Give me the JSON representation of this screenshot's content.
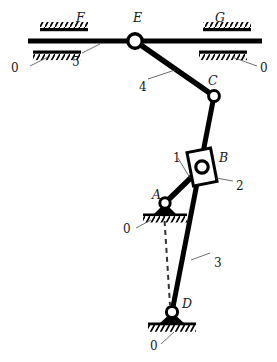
{
  "figure": {
    "background_color": "#ffffff",
    "line_color": "#000000",
    "label_color": "#1a1a1a",
    "width": 277,
    "height": 362
  },
  "joint_labels": [
    {
      "id": "F",
      "text": "F",
      "x": 76,
      "y": 12,
      "kind": "slider-guide-label"
    },
    {
      "id": "E",
      "text": "E",
      "x": 133,
      "y": 12,
      "kind": "pin-joint-label"
    },
    {
      "id": "G",
      "text": "G",
      "x": 215,
      "y": 12,
      "kind": "slider-guide-label"
    },
    {
      "id": "C",
      "text": "C",
      "x": 208,
      "y": 75,
      "kind": "pin-joint-label"
    },
    {
      "id": "B",
      "text": "B",
      "x": 219,
      "y": 152,
      "kind": "slider-block-label"
    },
    {
      "id": "A",
      "text": "A",
      "x": 152,
      "y": 189,
      "kind": "ground-pivot-label"
    },
    {
      "id": "D",
      "text": "D",
      "x": 182,
      "y": 298,
      "kind": "ground-pivot-label"
    }
  ],
  "link_labels": [
    {
      "id": "link5",
      "text": "5",
      "x": 72,
      "y": 56,
      "member": "horizontal-slider-bar"
    },
    {
      "id": "link4",
      "text": "4",
      "x": 139,
      "y": 81,
      "member": "coupler-E-to-C"
    },
    {
      "id": "link1",
      "text": "1",
      "x": 173,
      "y": 152,
      "member": "crank-A-to-B"
    },
    {
      "id": "link2",
      "text": "2",
      "x": 236,
      "y": 180,
      "member": "slider-block-B"
    },
    {
      "id": "link3",
      "text": "3",
      "x": 214,
      "y": 257,
      "member": "rocker-D-to-C"
    }
  ],
  "ground_labels": [
    {
      "id": "ground-F",
      "text": "0",
      "x": 11,
      "y": 62,
      "attached_to": "guide-F"
    },
    {
      "id": "ground-G",
      "text": "0",
      "x": 260,
      "y": 62,
      "attached_to": "guide-G"
    },
    {
      "id": "ground-A",
      "text": "0",
      "x": 123,
      "y": 223,
      "attached_to": "pivot-A"
    },
    {
      "id": "ground-D",
      "text": "0",
      "x": 150,
      "y": 340,
      "attached_to": "pivot-D"
    }
  ],
  "geometry": {
    "points": {
      "E": {
        "x": 135,
        "y": 41
      },
      "C": {
        "x": 214,
        "y": 96
      },
      "B": {
        "x": 202,
        "y": 167
      },
      "A": {
        "x": 165,
        "y": 203
      },
      "D": {
        "x": 172,
        "y": 312
      },
      "bar_left": {
        "x": 28,
        "y": 41
      },
      "bar_right": {
        "x": 262,
        "y": 41
      }
    },
    "guides": {
      "F": {
        "x": 64,
        "y": 41
      },
      "G": {
        "x": 226,
        "y": 41
      }
    },
    "reference_line": {
      "from": "A",
      "to": "D",
      "style": "dashed"
    }
  }
}
